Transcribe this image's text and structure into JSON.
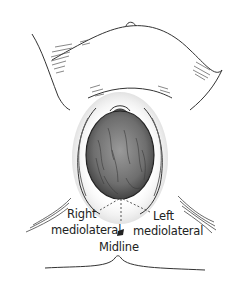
{
  "figure": {
    "labels": {
      "right_line1": "Right",
      "right_line2": "mediolateral",
      "left_line1": "Left",
      "left_line2": "mediolateral",
      "midline": "Midline"
    },
    "colors": {
      "line": "#333333",
      "head_fill": "#7a7a7a",
      "shading": "#555555",
      "background": "#ffffff"
    }
  }
}
